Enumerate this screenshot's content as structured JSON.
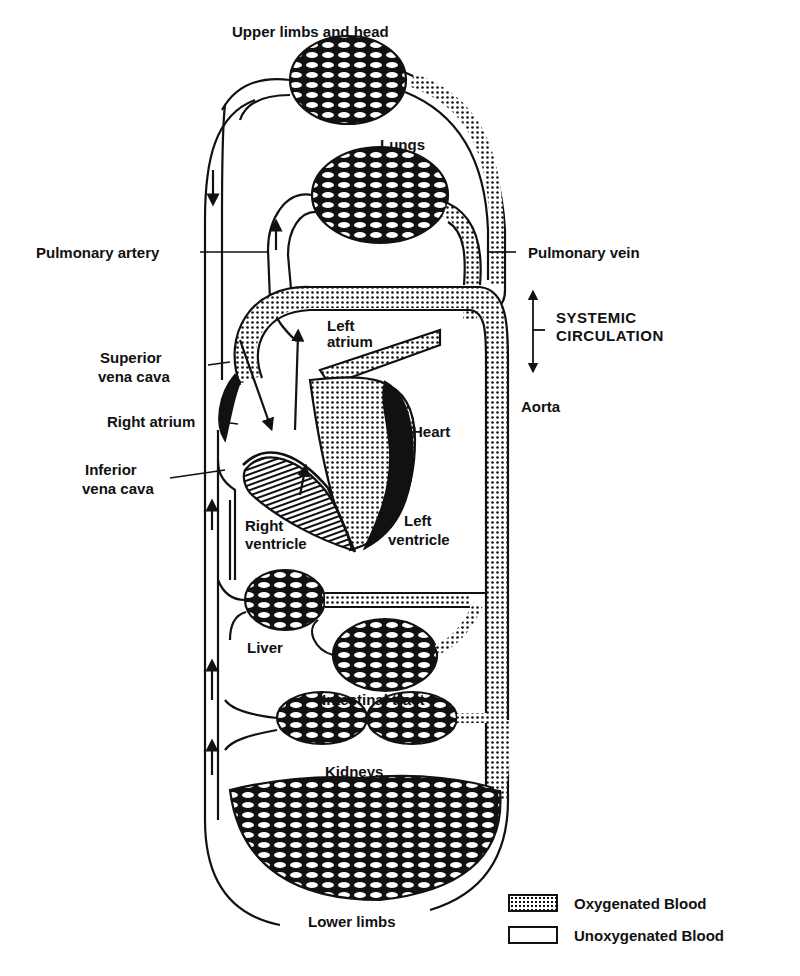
{
  "diagram": {
    "labels": {
      "upper_limbs_head": "Upper limbs and head",
      "lungs": "Lungs",
      "pulmonary_artery": "Pulmonary artery",
      "pulmonary_vein": "Pulmonary vein",
      "systemic_circulation_1": "SYSTEMIC",
      "systemic_circulation_2": "CIRCULATION",
      "left_atrium_1": "Left",
      "left_atrium_2": "atrium",
      "superior_vena_cava_1": "Superior",
      "superior_vena_cava_2": "vena cava",
      "right_atrium": "Right atrium",
      "aorta": "Aorta",
      "heart": "Heart",
      "inferior_vena_cava_1": "Inferior",
      "inferior_vena_cava_2": "vena cava",
      "right_ventricle_1": "Right",
      "right_ventricle_2": "ventricle",
      "left_ventricle_1": "Left",
      "left_ventricle_2": "ventricle",
      "liver": "Liver",
      "intestinal_tract": "Intestinal tract",
      "kidneys": "Kidneys",
      "lower_limbs": "Lower limbs"
    },
    "legend": [
      {
        "label": "Oxygenated Blood",
        "pattern": "dotted"
      },
      {
        "label": "Unoxygenated Blood",
        "pattern": "plain"
      }
    ],
    "colors": {
      "ink": "#111111",
      "paper": "#ffffff"
    }
  }
}
